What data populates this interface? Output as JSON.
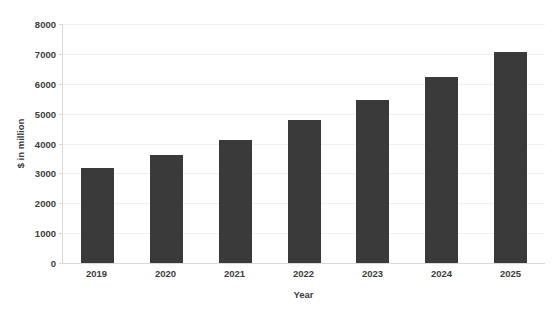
{
  "chart_data": {
    "type": "bar",
    "title": "",
    "xlabel": "Year",
    "ylabel": "$ in million",
    "categories": [
      "2019",
      "2020",
      "2021",
      "2022",
      "2023",
      "2024",
      "2025"
    ],
    "values": [
      3180,
      3610,
      4120,
      4790,
      5450,
      6210,
      7080
    ],
    "series": [
      {
        "name": "",
        "values": [
          3180,
          3610,
          4120,
          4790,
          5450,
          6210,
          7080
        ]
      }
    ],
    "ylim": [
      0,
      8000
    ],
    "ytick_step": 1000,
    "yticks": [
      "8000",
      "7000",
      "6000",
      "5000",
      "4000",
      "3000",
      "2000",
      "1000",
      "0"
    ],
    "ytick_values": [
      8000,
      7000,
      6000,
      5000,
      4000,
      3000,
      2000,
      1000,
      0
    ],
    "grid": true,
    "grid_axis": "y",
    "legend": false,
    "legend_position": "none",
    "bar_color": "#3a3a3a",
    "gridline_color": "#f0f0f0",
    "axis_color": "#d9d9d9",
    "background_color": "#ffffff",
    "text_color": "#3c3c3c"
  }
}
